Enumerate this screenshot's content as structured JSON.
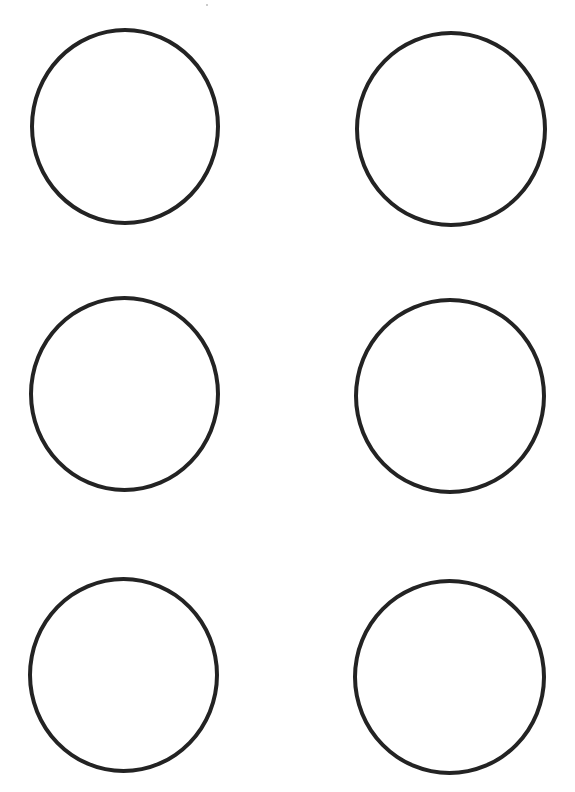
{
  "sheet": {
    "description": "Printable template sheet with six empty circle outlines arranged in 3 rows by 2 columns",
    "layout": {
      "rows": 3,
      "columns": 2
    },
    "stroke_color": "#232323",
    "background_color": "#ffffff",
    "circles": [
      {
        "row": 1,
        "col": 1,
        "label": ""
      },
      {
        "row": 1,
        "col": 2,
        "label": ""
      },
      {
        "row": 2,
        "col": 1,
        "label": ""
      },
      {
        "row": 2,
        "col": 2,
        "label": ""
      },
      {
        "row": 3,
        "col": 1,
        "label": ""
      },
      {
        "row": 3,
        "col": 2,
        "label": ""
      }
    ]
  }
}
